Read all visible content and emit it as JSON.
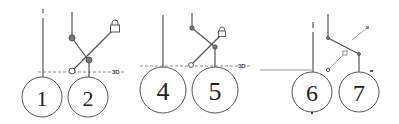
{
  "panels": [
    {
      "id": "panel-1",
      "circles": [
        {
          "label": "1",
          "cx": 42,
          "cy": 97,
          "r": 20
        },
        {
          "label": "2",
          "cx": 88,
          "cy": 97,
          "r": 20
        }
      ],
      "baseline_label": "3D"
    },
    {
      "id": "panel-2",
      "circles": [
        {
          "label": "4",
          "cx": 163,
          "cy": 90,
          "r": 23
        },
        {
          "label": "5",
          "cx": 215,
          "cy": 90,
          "r": 23
        }
      ],
      "baseline_label": "3D"
    },
    {
      "id": "panel-3",
      "circles": [
        {
          "label": "6",
          "cx": 312,
          "cy": 92,
          "r": 20
        },
        {
          "label": "7",
          "cx": 359,
          "cy": 92,
          "r": 20
        }
      ]
    }
  ],
  "icons": {
    "lock": "lock-icon"
  },
  "colors": {
    "stroke": "#555555",
    "dash": "#888888",
    "background": "#ffffff"
  }
}
